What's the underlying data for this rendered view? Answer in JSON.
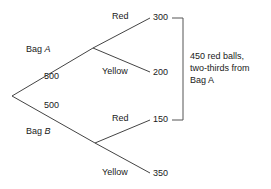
{
  "diagram": {
    "type": "probability-tree",
    "title": "",
    "background_color": "#ffffff",
    "line_color": "#444444",
    "text_color": "#1a1a1a"
  },
  "branches": {
    "bag_a": {
      "label_prefix": "Bag ",
      "label_italic": "A",
      "count": "500"
    },
    "bag_b": {
      "label_prefix": "Bag ",
      "label_italic": "B",
      "count": "500"
    }
  },
  "leaves": {
    "a_red": {
      "label": "Red",
      "value": "300"
    },
    "a_yellow": {
      "label": "Yellow",
      "value": "200"
    },
    "b_red": {
      "label": "Red",
      "value": "150"
    },
    "b_yellow": {
      "label": "Yellow",
      "value": "350"
    }
  },
  "annotation": {
    "line1": "450 red balls,",
    "line2": "two-thirds from",
    "line3_prefix": "Bag ",
    "line3_italic": "A"
  }
}
